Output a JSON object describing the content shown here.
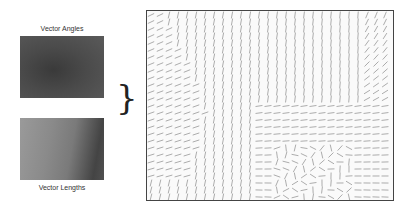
{
  "panels": {
    "angles_label": "Vector Angles",
    "lengths_label": "Vector Lengths",
    "bracket": "}"
  },
  "vector_field": {
    "description": "Flow field of short line segments combining angle and length maps",
    "line_color": "#8a8a8a",
    "border_color": "#444444"
  }
}
